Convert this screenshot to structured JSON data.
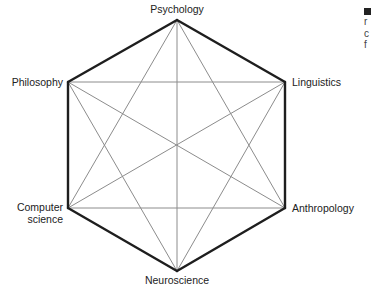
{
  "diagram": {
    "type": "complete-graph-hexagon",
    "nodes": [
      {
        "id": "psychology",
        "label": "Psychology",
        "x": 177,
        "y": 20
      },
      {
        "id": "linguistics",
        "label": "Linguistics",
        "x": 285,
        "y": 82
      },
      {
        "id": "anthropology",
        "label": "Anthropology",
        "x": 285,
        "y": 208
      },
      {
        "id": "neuroscience",
        "label": "Neuroscience",
        "x": 177,
        "y": 271
      },
      {
        "id": "computer_science",
        "label_line1": "Computer",
        "label_line2": "science",
        "x": 68,
        "y": 208
      },
      {
        "id": "philosophy",
        "label": "Philosophy",
        "x": 68,
        "y": 82
      }
    ],
    "outer_edge_color": "#1e1e1e",
    "inner_edge_color": "#8c8c8c",
    "outer_edge_width": 2.4,
    "inner_edge_width": 1
  },
  "side_fragment": {
    "marker_color": "#222222",
    "lines": [
      "r",
      "c",
      "f"
    ]
  }
}
